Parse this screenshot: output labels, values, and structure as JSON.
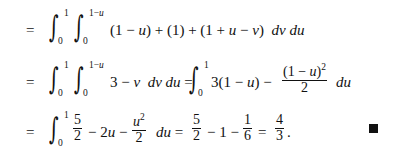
{
  "rows": [
    {
      "relation": "=",
      "outer_integral": {
        "lower": "0",
        "upper": "1"
      },
      "inner_integral": {
        "lower": "0",
        "upper": "1−u"
      },
      "integrand": "(1 − u) + (1) + (1 + u − v) dv du"
    },
    {
      "relation": "=",
      "outer_integral": {
        "lower": "0",
        "upper": "1"
      },
      "inner_integral": {
        "lower": "0",
        "upper": "1−u"
      },
      "integrand": "3 − v dv du",
      "equals_2": "=",
      "integral_2": {
        "lower": "0",
        "upper": "1"
      },
      "term_a": "3(1 − u) −",
      "fraction": {
        "numerator": "(1 − u)²",
        "denominator": "2"
      },
      "differential": "du"
    },
    {
      "relation": "=",
      "outer_integral": {
        "lower": "0",
        "upper": "1"
      },
      "frac_1": {
        "numerator": "5",
        "denominator": "2"
      },
      "term_b": "− 2u −",
      "frac_2": {
        "numerator": "u²",
        "denominator": "2"
      },
      "differential": "du =",
      "frac_3": {
        "numerator": "5",
        "denominator": "2"
      },
      "term_c": "− 1 −",
      "frac_4": {
        "numerator": "1",
        "denominator": "6"
      },
      "equals": "=",
      "frac_5": {
        "numerator": "4",
        "denominator": "3"
      },
      "period": "."
    }
  ],
  "end_of_proof_symbol": "qed-square"
}
